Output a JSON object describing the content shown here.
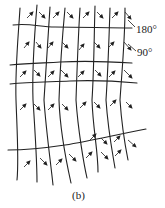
{
  "labels": {
    "angle_top": "180°",
    "angle_mid": "90°"
  },
  "caption": "(b)",
  "colors": {
    "line": "#222222",
    "background": "#ffffff"
  }
}
